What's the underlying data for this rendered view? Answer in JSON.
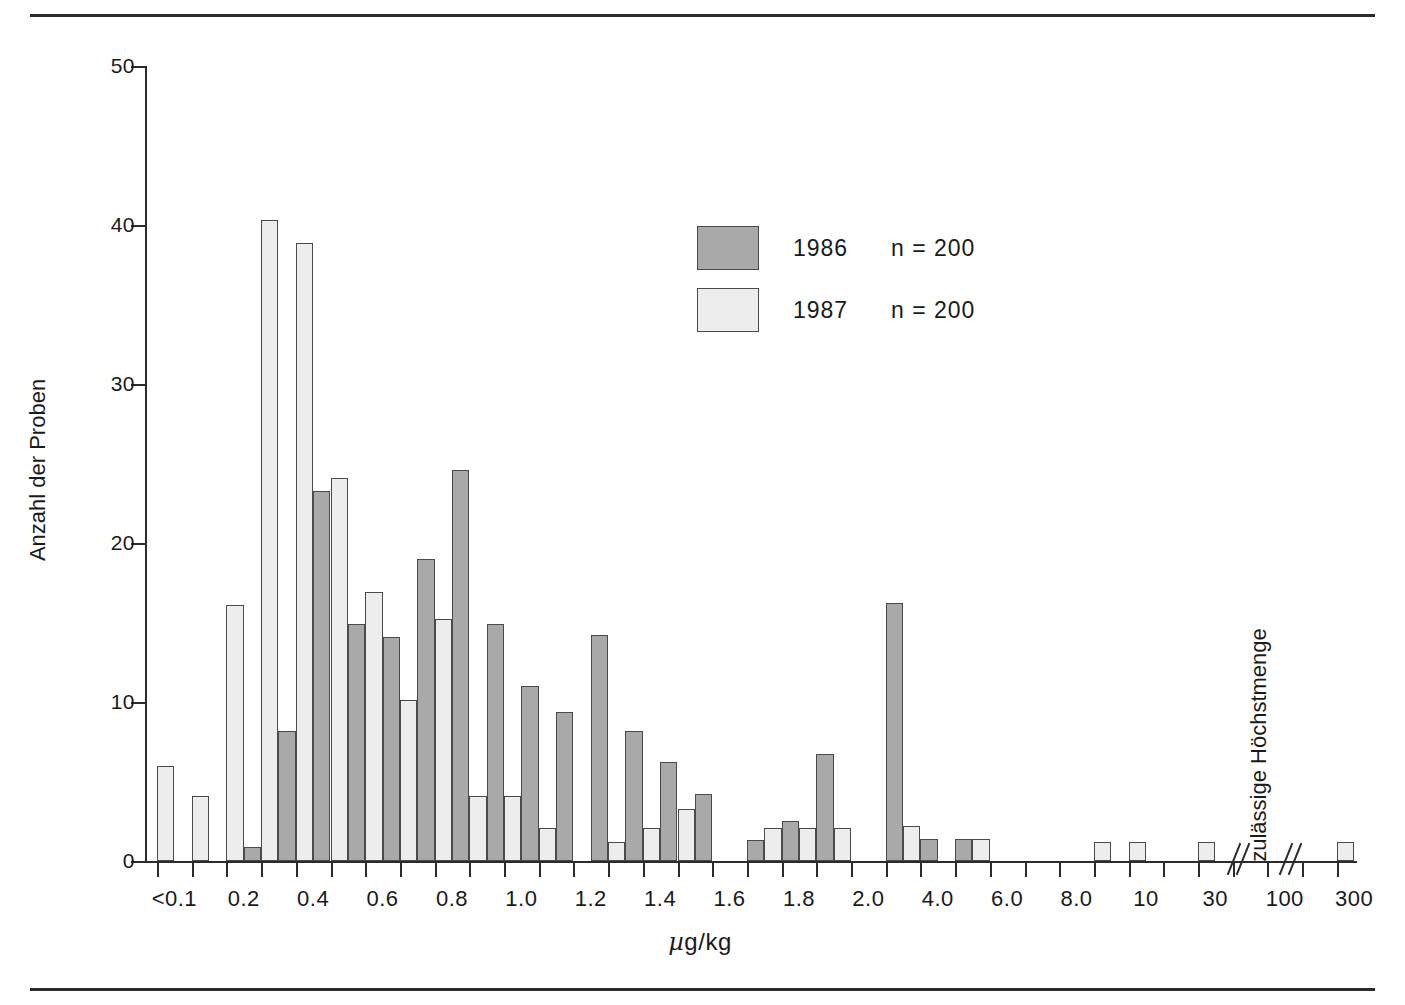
{
  "chart_data": {
    "type": "bar",
    "title": "",
    "xlabel": "µg/kg",
    "ylabel": "Anzahl der Proben",
    "ylim": [
      0,
      50
    ],
    "yticks": [
      0,
      10,
      20,
      30,
      40,
      50
    ],
    "ytick_labels": [
      "0",
      "10",
      "20",
      "30",
      "40",
      "50"
    ],
    "grid": false,
    "legend_position": "upper-center",
    "series": [
      {
        "name": "1986",
        "label": "1986",
        "n_label": "n = 200",
        "n": 200,
        "color": "#a9a9a9"
      },
      {
        "name": "1987",
        "label": "1987",
        "n_label": "n = 200",
        "n": 200,
        "color": "#ededed"
      }
    ],
    "annotations": [
      {
        "text": "zulässige Höchstmenge",
        "orientation": "vertical",
        "near_tick": "100"
      }
    ],
    "axis_breaks": 2,
    "xtick_labels": [
      "<0.1",
      "",
      "0.2",
      "",
      "0.4",
      "",
      "0.6",
      "",
      "0.8",
      "",
      "1.0",
      "",
      "1.2",
      "",
      "1.4",
      "",
      "1.6",
      "",
      "1.8",
      "",
      "2.0",
      "",
      "4.0",
      "",
      "6.0",
      "",
      "8.0",
      "",
      "10",
      "",
      "30",
      "",
      "100",
      "",
      "300"
    ],
    "bars": [
      {
        "bin": "<0.1",
        "series": "1987",
        "value": 6.0,
        "slot": 0
      },
      {
        "bin": "0.2",
        "series": "1987",
        "value": 4.1,
        "slot": 2
      },
      {
        "bin": "0.3",
        "series": "1987",
        "value": 16.1,
        "slot": 4
      },
      {
        "bin": "0.35",
        "series": "1986",
        "value": 0.9,
        "slot": 5
      },
      {
        "bin": "0.4",
        "series": "1987",
        "value": 40.3,
        "slot": 6
      },
      {
        "bin": "0.45",
        "series": "1986",
        "value": 8.2,
        "slot": 7
      },
      {
        "bin": "0.5",
        "series": "1987",
        "value": 38.9,
        "slot": 8
      },
      {
        "bin": "0.55",
        "series": "1986",
        "value": 23.3,
        "slot": 9
      },
      {
        "bin": "0.6",
        "series": "1987",
        "value": 24.1,
        "slot": 10
      },
      {
        "bin": "0.65",
        "series": "1986",
        "value": 14.9,
        "slot": 11
      },
      {
        "bin": "0.7",
        "series": "1987",
        "value": 16.9,
        "slot": 12
      },
      {
        "bin": "0.75",
        "series": "1986",
        "value": 14.1,
        "slot": 13
      },
      {
        "bin": "0.8",
        "series": "1987",
        "value": 10.1,
        "slot": 14
      },
      {
        "bin": "0.85",
        "series": "1986",
        "value": 19.0,
        "slot": 15
      },
      {
        "bin": "0.9",
        "series": "1987",
        "value": 15.2,
        "slot": 16
      },
      {
        "bin": "0.95",
        "series": "1986",
        "value": 24.6,
        "slot": 17
      },
      {
        "bin": "1.0",
        "series": "1987",
        "value": 4.1,
        "slot": 18
      },
      {
        "bin": "1.05",
        "series": "1986",
        "value": 14.9,
        "slot": 19
      },
      {
        "bin": "1.1",
        "series": "1987",
        "value": 4.1,
        "slot": 20
      },
      {
        "bin": "1.15",
        "series": "1986",
        "value": 11.0,
        "slot": 21
      },
      {
        "bin": "1.2",
        "series": "1987",
        "value": 2.1,
        "slot": 22
      },
      {
        "bin": "1.25",
        "series": "1986",
        "value": 9.4,
        "slot": 23
      },
      {
        "bin": "1.35",
        "series": "1986",
        "value": 14.2,
        "slot": 25
      },
      {
        "bin": "1.4",
        "series": "1987",
        "value": 1.2,
        "slot": 26
      },
      {
        "bin": "1.45",
        "series": "1986",
        "value": 8.2,
        "slot": 27
      },
      {
        "bin": "1.5",
        "series": "1987",
        "value": 2.1,
        "slot": 28
      },
      {
        "bin": "1.55",
        "series": "1986",
        "value": 6.2,
        "slot": 29
      },
      {
        "bin": "1.6",
        "series": "1987",
        "value": 3.3,
        "slot": 30
      },
      {
        "bin": "1.65",
        "series": "1986",
        "value": 4.2,
        "slot": 31
      },
      {
        "bin": "1.8",
        "series": "1986",
        "value": 1.3,
        "slot": 34
      },
      {
        "bin": "1.85",
        "series": "1987",
        "value": 2.1,
        "slot": 35
      },
      {
        "bin": "1.9",
        "series": "1986",
        "value": 2.5,
        "slot": 36
      },
      {
        "bin": "1.95",
        "series": "1987",
        "value": 2.1,
        "slot": 37
      },
      {
        "bin": "2.0",
        "series": "1986",
        "value": 6.7,
        "slot": 38
      },
      {
        "bin": "2.05",
        "series": "1987",
        "value": 2.1,
        "slot": 39
      },
      {
        "bin": "3.0",
        "series": "1986",
        "value": 16.2,
        "slot": 42
      },
      {
        "bin": "3.5",
        "series": "1987",
        "value": 2.2,
        "slot": 43
      },
      {
        "bin": "4.0",
        "series": "1986",
        "value": 1.4,
        "slot": 44
      },
      {
        "bin": "5.0",
        "series": "1986",
        "value": 1.4,
        "slot": 46
      },
      {
        "bin": "5.5",
        "series": "1987",
        "value": 1.4,
        "slot": 47
      },
      {
        "bin": "9.0",
        "series": "1987",
        "value": 1.2,
        "slot": 54
      },
      {
        "bin": "10",
        "series": "1987",
        "value": 1.2,
        "slot": 56
      },
      {
        "bin": "30",
        "series": "1987",
        "value": 1.2,
        "slot": 60
      },
      {
        "bin": "300",
        "series": "1987",
        "value": 1.2,
        "slot": 68
      }
    ]
  },
  "layout": {
    "x_slot_width": 17.35,
    "x_origin": 12,
    "bar_width": 17.35,
    "y_px_per_unit": 15.9,
    "plot_height": 795
  }
}
